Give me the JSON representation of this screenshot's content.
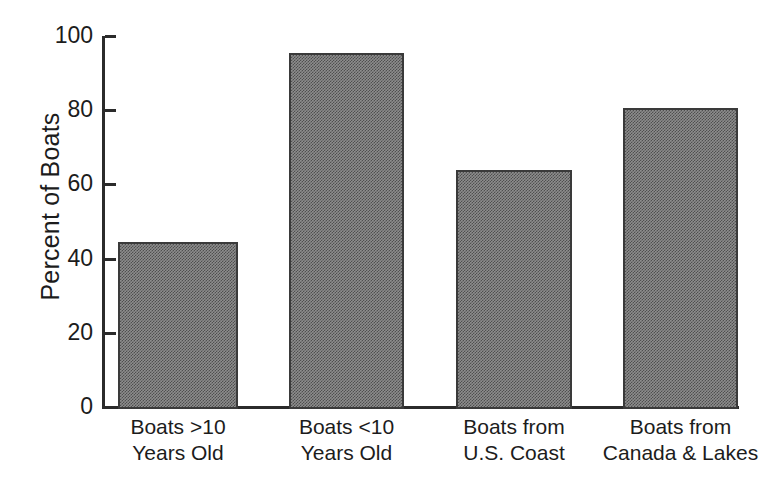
{
  "chart_data": {
    "type": "bar",
    "title": "",
    "subtitle": "",
    "xlabel": "",
    "ylabel": "Percent of Boats",
    "ylim": [
      0,
      100
    ],
    "ytick_values": [
      0,
      20,
      40,
      60,
      80,
      100
    ],
    "ytick_labels": [
      "0",
      "20",
      "40",
      "60",
      "80",
      "100"
    ],
    "grid": false,
    "legend": null,
    "bar_fill_color": "#8d8d8d",
    "bar_edge_color": "#3a3a3a",
    "axis_color": "#2b2b2b",
    "background_color": "#ffffff",
    "categories": [
      "Boats >10\nYears Old",
      "Boats <10\nYears Old",
      "Boats from\nU.S. Coast",
      "Boats from\nCanada & Lakes"
    ],
    "category_lines": [
      [
        "Boats >10",
        "Years Old"
      ],
      [
        "Boats <10",
        "Years Old"
      ],
      [
        "Boats from",
        "U.S. Coast"
      ],
      [
        "Boats from",
        "Canada & Lakes"
      ]
    ],
    "values": [
      44.5,
      95.3,
      64.0,
      80.5
    ]
  }
}
